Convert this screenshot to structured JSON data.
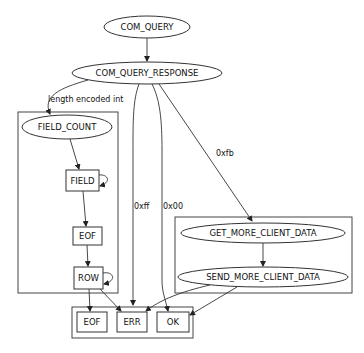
{
  "diagram": {
    "nodes": {
      "com_query": "COM_QUERY",
      "com_query_response": "COM_QUERY_RESPONSE",
      "field_count": "FIELD_COUNT",
      "field": "FIELD",
      "eof_inner": "EOF",
      "row": "ROW",
      "eof_final": "EOF",
      "err": "ERR",
      "ok": "OK",
      "get_more_client_data": "GET_MORE_CLIENT_DATA",
      "send_more_client_data": "SEND_MORE_CLIENT_DATA"
    },
    "edge_labels": {
      "length_encoded_int": "length encoded int",
      "xff": "0xff",
      "x00": "0x00",
      "xfb": "0xfb"
    },
    "edges": [
      {
        "from": "COM_QUERY",
        "to": "COM_QUERY_RESPONSE",
        "label": ""
      },
      {
        "from": "COM_QUERY_RESPONSE",
        "to": "FIELD_COUNT",
        "label": "length encoded int"
      },
      {
        "from": "COM_QUERY_RESPONSE",
        "to": "ERR",
        "label": "0xff"
      },
      {
        "from": "COM_QUERY_RESPONSE",
        "to": "OK",
        "label": "0x00"
      },
      {
        "from": "COM_QUERY_RESPONSE",
        "to": "GET_MORE_CLIENT_DATA",
        "label": "0xfb"
      },
      {
        "from": "FIELD_COUNT",
        "to": "FIELD",
        "label": ""
      },
      {
        "from": "FIELD",
        "to": "FIELD",
        "label": ""
      },
      {
        "from": "FIELD",
        "to": "EOF",
        "label": ""
      },
      {
        "from": "EOF",
        "to": "ROW",
        "label": ""
      },
      {
        "from": "ROW",
        "to": "ROW",
        "label": ""
      },
      {
        "from": "ROW",
        "to": "EOF (final)",
        "label": ""
      },
      {
        "from": "ROW",
        "to": "ERR",
        "label": ""
      },
      {
        "from": "GET_MORE_CLIENT_DATA",
        "to": "SEND_MORE_CLIENT_DATA",
        "label": ""
      },
      {
        "from": "SEND_MORE_CLIENT_DATA",
        "to": "ERR",
        "label": ""
      },
      {
        "from": "SEND_MORE_CLIENT_DATA",
        "to": "OK",
        "label": ""
      }
    ],
    "colors": {
      "stroke": "#333333",
      "background": "#ffffff",
      "text": "#111111"
    }
  }
}
